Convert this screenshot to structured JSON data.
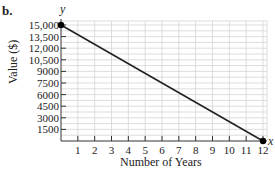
{
  "part_label": "b.",
  "chart_data": {
    "type": "line",
    "title": "",
    "xlabel": "Number of Years",
    "ylabel": "Value ($)",
    "x_axis_name": "x",
    "y_axis_name": "y",
    "x_ticks": [
      1,
      2,
      3,
      4,
      5,
      6,
      7,
      8,
      9,
      10,
      11,
      12
    ],
    "y_ticks": [
      "1500",
      "3000",
      "4500",
      "6000",
      "7500",
      "9000",
      "10,500",
      "12,000",
      "13,500",
      "15,000"
    ],
    "y_tick_values": [
      1500,
      3000,
      4500,
      6000,
      7500,
      9000,
      10500,
      12000,
      13500,
      15000
    ],
    "xlim": [
      0,
      12
    ],
    "ylim": [
      0,
      15000
    ],
    "grid": true,
    "series": [
      {
        "name": "Value",
        "x": [
          0,
          12
        ],
        "y": [
          15000,
          0
        ],
        "endpoints_marked": true
      }
    ]
  }
}
